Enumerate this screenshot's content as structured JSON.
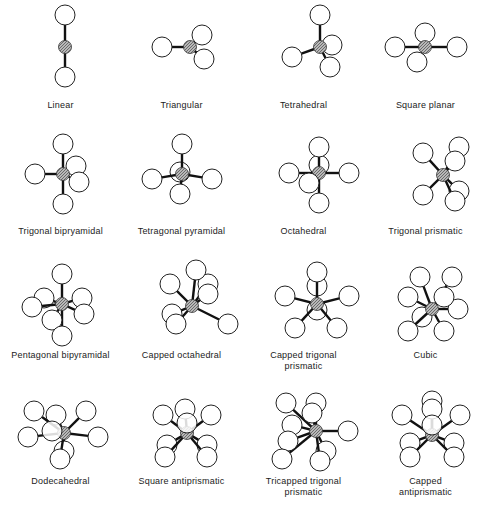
{
  "figure": {
    "colors": {
      "background": "#ffffff",
      "ligand_fill": "#ffffff",
      "ligand_stroke": "#222222",
      "center_fill": "#9a9a9a",
      "bond": "#111111"
    },
    "geometries": [
      {
        "id": "linear",
        "label": "Linear",
        "cn": 2,
        "cx": 65,
        "cy": 47,
        "lx": 62,
        "ly": 100,
        "ligands": [
          [
            0,
            -32,
            0
          ],
          [
            0,
            30,
            0
          ]
        ]
      },
      {
        "id": "triangular",
        "label": "Triangular",
        "cn": 3,
        "cx": 69,
        "cy": 47,
        "lx": 0,
        "ly": 100,
        "ligands": [
          [
            -28,
            0,
            0
          ],
          [
            12,
            -12,
            0
          ],
          [
            14,
            12,
            0
          ]
        ]
      },
      {
        "id": "tetrahedral",
        "label": "Tetrahedral",
        "cn": 4,
        "cx": 77,
        "cy": 47,
        "lx": 0,
        "ly": 100,
        "ligands": [
          [
            0,
            -32,
            0
          ],
          [
            -28,
            10,
            0
          ],
          [
            12,
            -2,
            -1
          ],
          [
            10,
            20,
            0
          ]
        ]
      },
      {
        "id": "square_planar",
        "label": "Square planar",
        "cn": 4,
        "cx": 60,
        "cy": 47,
        "lx": 0,
        "ly": 100,
        "ligands": [
          [
            0,
            -14,
            -1
          ],
          [
            -30,
            0,
            0
          ],
          [
            32,
            0,
            0
          ],
          [
            -8,
            15,
            0
          ]
        ]
      },
      {
        "id": "trigonal_bipyramidal",
        "label": "Trigonal bipryamidal",
        "cn": 5,
        "cx": 63,
        "cy": 47,
        "lx": 0,
        "ly": 100,
        "ligands": [
          [
            0,
            -30,
            0
          ],
          [
            13,
            -8,
            -1
          ],
          [
            -28,
            0,
            0
          ],
          [
            16,
            8,
            0
          ],
          [
            0,
            30,
            0
          ]
        ]
      },
      {
        "id": "tetragonal_pyramidal",
        "label": "Tetragonal pyramidal",
        "cn": 5,
        "cx": 61,
        "cy": 47,
        "lx": 0,
        "ly": 100,
        "ligands": [
          [
            0,
            -30,
            0
          ],
          [
            -30,
            5,
            0
          ],
          [
            30,
            5,
            0
          ],
          [
            -2,
            -2,
            -1
          ],
          [
            -2,
            20,
            0
          ]
        ]
      },
      {
        "id": "octahedral",
        "label": "Octahedral",
        "cn": 6,
        "cx": 76,
        "cy": 46,
        "lx": 0,
        "ly": 100,
        "ligands": [
          [
            0,
            -26,
            0
          ],
          [
            0,
            -8,
            -1
          ],
          [
            -30,
            0,
            0
          ],
          [
            30,
            0,
            0
          ],
          [
            -10,
            10,
            0
          ],
          [
            0,
            30,
            0
          ]
        ]
      },
      {
        "id": "trigonal_prismatic",
        "label": "Trigonal prismatic",
        "cn": 6,
        "cx": 78,
        "cy": 48,
        "lx": 0,
        "ly": 100,
        "ligands": [
          [
            16,
            -28,
            -1
          ],
          [
            -20,
            -22,
            0
          ],
          [
            12,
            -14,
            0
          ],
          [
            16,
            16,
            -1
          ],
          [
            -20,
            20,
            0
          ],
          [
            12,
            26,
            0
          ]
        ]
      },
      {
        "id": "pentagonal_bipyramidal",
        "label": "Pentagonal bipyramidal",
        "cn": 7,
        "cx": 62,
        "cy": 50,
        "lx": 0,
        "ly": 100,
        "ligands": [
          [
            0,
            -30,
            0
          ],
          [
            -18,
            -6,
            -1
          ],
          [
            20,
            -6,
            -1
          ],
          [
            -30,
            3,
            0
          ],
          [
            22,
            10,
            0
          ],
          [
            -10,
            16,
            0
          ],
          [
            0,
            32,
            0
          ]
        ]
      },
      {
        "id": "capped_octahedral",
        "label": "Capped octahedral",
        "cn": 7,
        "cx": 71,
        "cy": 52,
        "lx": 0,
        "ly": 100,
        "ligands": [
          [
            4,
            -36,
            0
          ],
          [
            16,
            -22,
            -1
          ],
          [
            -22,
            -22,
            0
          ],
          [
            16,
            -12,
            0
          ],
          [
            -20,
            8,
            -1
          ],
          [
            36,
            18,
            0
          ],
          [
            -16,
            18,
            0
          ]
        ]
      },
      {
        "id": "capped_trigonal_prismatic",
        "label": "Capped trigonal prismatic",
        "label2": "prismatic",
        "cn": 7,
        "cx": 74,
        "cy": 50,
        "lx": 0,
        "ly": 96,
        "ligands": [
          [
            0,
            -32,
            0
          ],
          [
            0,
            -18,
            -1
          ],
          [
            -32,
            -8,
            0
          ],
          [
            32,
            -8,
            0
          ],
          [
            0,
            6,
            -1
          ],
          [
            -22,
            24,
            0
          ],
          [
            20,
            24,
            0
          ]
        ]
      },
      {
        "id": "cubic",
        "label": "Cubic",
        "cn": 8,
        "cx": 67,
        "cy": 55,
        "lx": 0,
        "ly": 96,
        "ligands": [
          [
            -12,
            -32,
            0
          ],
          [
            20,
            -32,
            0
          ],
          [
            -24,
            -12,
            0
          ],
          [
            12,
            -12,
            0
          ],
          [
            -10,
            8,
            -1
          ],
          [
            26,
            0,
            -1
          ],
          [
            -24,
            22,
            0
          ],
          [
            12,
            22,
            0
          ]
        ]
      },
      {
        "id": "dodecahedral",
        "label": "Dodecahedral",
        "cn": 8,
        "cx": 64,
        "cy": 52,
        "lx": 0,
        "ly": 100,
        "ligands": [
          [
            -30,
            -22,
            0
          ],
          [
            -8,
            -18,
            -1
          ],
          [
            22,
            -22,
            0
          ],
          [
            -36,
            4,
            0
          ],
          [
            -12,
            -2,
            2
          ],
          [
            34,
            4,
            0
          ],
          [
            0,
            18,
            -1
          ],
          [
            -4,
            26,
            0
          ]
        ]
      },
      {
        "id": "square_antiprismatic",
        "label": "Square antiprismatic",
        "cn": 8,
        "cx": 66,
        "cy": 52,
        "lx": 0,
        "ly": 100,
        "ligands": [
          [
            -2,
            -24,
            -1
          ],
          [
            -24,
            -18,
            0
          ],
          [
            24,
            -18,
            0
          ],
          [
            0,
            -10,
            1
          ],
          [
            -20,
            12,
            -1
          ],
          [
            20,
            12,
            -1
          ],
          [
            -22,
            24,
            0
          ],
          [
            20,
            24,
            0
          ]
        ]
      },
      {
        "id": "tricapped_trigonal_prismatic",
        "label": "Tricapped trigonal",
        "label2": "prismatic",
        "cn": 9,
        "cx": 73,
        "cy": 50,
        "lx": 0,
        "ly": 96,
        "ligands": [
          [
            -30,
            -28,
            0
          ],
          [
            0,
            -28,
            -1
          ],
          [
            -4,
            -18,
            0
          ],
          [
            -24,
            -6,
            -1
          ],
          [
            32,
            0,
            0
          ],
          [
            -28,
            10,
            0
          ],
          [
            10,
            20,
            -1
          ],
          [
            -34,
            28,
            0
          ],
          [
            4,
            30,
            0
          ]
        ]
      },
      {
        "id": "capped_antiprismatic",
        "label": "Capped",
        "label2": "antiprismatic",
        "cn": 9,
        "cx": 67,
        "cy": 54,
        "lx": 0,
        "ly": 96,
        "ligands": [
          [
            0,
            -34,
            -1
          ],
          [
            0,
            -26,
            0
          ],
          [
            -30,
            -20,
            0
          ],
          [
            28,
            -20,
            0
          ],
          [
            0,
            -10,
            1
          ],
          [
            -22,
            8,
            -1
          ],
          [
            22,
            8,
            -1
          ],
          [
            -22,
            22,
            0
          ],
          [
            22,
            22,
            0
          ]
        ]
      }
    ]
  }
}
